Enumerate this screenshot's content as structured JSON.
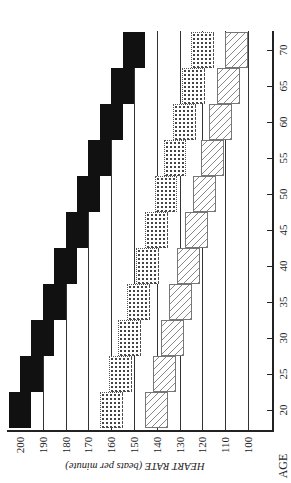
{
  "chart_data": {
    "type": "bar",
    "orientation": "rotated 90° (age on vertical axis, heart rate on horizontal axis)",
    "title": "",
    "xlabel": "AGE",
    "ylabel": "HEART RATE (beats per minute)",
    "categories": [
      20,
      25,
      30,
      35,
      40,
      45,
      50,
      55,
      60,
      65,
      70
    ],
    "age_ticks": [
      "20",
      "25",
      "30",
      "35",
      "40",
      "45",
      "50",
      "55",
      "60",
      "65",
      "70"
    ],
    "hr_ticks": [
      "200",
      "190",
      "180",
      "170",
      "160",
      "150",
      "140",
      "130",
      "120",
      "110",
      "100"
    ],
    "ylim": [
      100,
      205
    ],
    "grid": true,
    "series": [
      {
        "name": "Maximum heart rate",
        "pattern": "solid-black",
        "center": [
          200,
          195,
          190,
          185,
          180,
          175,
          170,
          165,
          160,
          155,
          150
        ],
        "low": [
          195,
          190,
          185,
          180,
          175,
          170,
          165,
          160,
          155,
          150,
          145
        ],
        "high": [
          205,
          200,
          195,
          190,
          185,
          180,
          175,
          170,
          165,
          160,
          155
        ]
      },
      {
        "name": "Upper target zone (≈80%)",
        "pattern": "dotted",
        "center": [
          160,
          156,
          152,
          148,
          144,
          140,
          136,
          132,
          128,
          124,
          120
        ],
        "low": [
          155,
          151,
          147,
          143,
          139,
          135,
          131,
          127,
          123,
          119,
          115
        ],
        "high": [
          165,
          161,
          157,
          153,
          149,
          145,
          141,
          137,
          133,
          129,
          125
        ]
      },
      {
        "name": "Lower target zone (≈70%)",
        "pattern": "hatched",
        "center": [
          140,
          136.5,
          133,
          129.5,
          126,
          122.5,
          119,
          115.5,
          112,
          108.5,
          105
        ],
        "low": [
          135,
          131.5,
          128,
          124.5,
          121,
          117.5,
          114,
          110.5,
          107,
          103.5,
          100
        ],
        "high": [
          145,
          141.5,
          138,
          134.5,
          131,
          127.5,
          124,
          120.5,
          117,
          113.5,
          110
        ]
      }
    ]
  },
  "labels": {
    "y_title": "HEART RATE (beats per minute)",
    "x_title": "AGE"
  }
}
